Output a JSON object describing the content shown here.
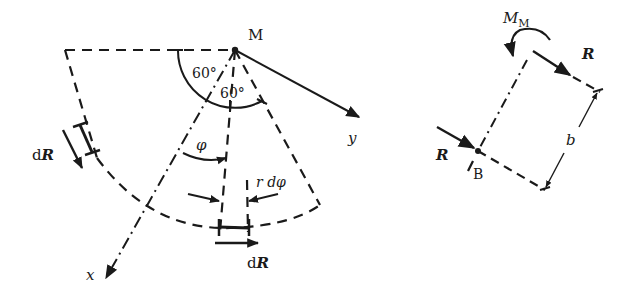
{
  "figure": {
    "left_diagram": {
      "point_label": "M",
      "angle_outer": "60°",
      "angle_inner": "60°",
      "axis_x_label": "x",
      "axis_y_label": "y",
      "angle_var": "φ",
      "arc_element_label": "r dφ",
      "force_element_left": {
        "prefix": "d",
        "symbol": "R"
      },
      "force_element_bottom": {
        "prefix": "d",
        "symbol": "R"
      }
    },
    "right_diagram": {
      "moment_label": {
        "symbol": "M",
        "subscript": "M"
      },
      "force_top": "R",
      "force_left": "R",
      "point_label": "B",
      "distance_label": "b"
    },
    "colors": {
      "ink": "#1a1a1a",
      "background": "#ffffff"
    }
  }
}
